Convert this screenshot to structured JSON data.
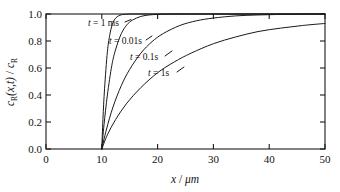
{
  "figure": {
    "background_color": "#ffffff",
    "line_color": "#1a1a1a"
  },
  "chart_data": {
    "type": "line",
    "title": "",
    "xlabel": "x / μm",
    "ylabel": "c_R(x,t) / c_R",
    "xlim": [
      0,
      50
    ],
    "ylim": [
      0.0,
      1.0
    ],
    "xticks": [
      0,
      10,
      20,
      30,
      40,
      50
    ],
    "xtick_labels": [
      "0",
      "10",
      "20",
      "30",
      "40",
      "50"
    ],
    "yticks": [
      0.0,
      0.2,
      0.4,
      0.6,
      0.8,
      1.0
    ],
    "ytick_labels": [
      "0.0",
      "0.2",
      "0.4",
      "0.6",
      "0.8",
      "1.0"
    ],
    "grid": false,
    "legend_position": "inline-annotations",
    "x_origin_of_diffusion": 10,
    "series": [
      {
        "name": "t = 1 ms",
        "label": "t = 1 ms",
        "x": [
          10,
          10.2,
          10.5,
          11,
          11.5,
          12,
          12.5,
          13,
          13.5,
          14,
          15,
          16,
          18,
          20,
          25,
          30,
          40,
          50
        ],
        "values": [
          0.0,
          0.22,
          0.45,
          0.72,
          0.86,
          0.935,
          0.97,
          0.986,
          0.994,
          0.997,
          0.9995,
          1.0,
          1.0,
          1.0,
          1.0,
          1.0,
          1.0,
          1.0
        ]
      },
      {
        "name": "t = 0.01s",
        "label": "t = 0.01s",
        "x": [
          10,
          10.4,
          11,
          11.8,
          12.5,
          13.5,
          14.5,
          15.5,
          17,
          18.5,
          20,
          22,
          25,
          30,
          35,
          40,
          45,
          50
        ],
        "values": [
          0.0,
          0.18,
          0.4,
          0.62,
          0.74,
          0.855,
          0.92,
          0.955,
          0.982,
          0.993,
          0.997,
          0.9992,
          1.0,
          1.0,
          1.0,
          1.0,
          1.0,
          1.0
        ]
      },
      {
        "name": "t = 0.1s",
        "label": "t = 0.1s",
        "x": [
          10,
          10.8,
          12,
          13.5,
          15,
          17,
          19,
          21,
          24,
          27,
          30,
          34,
          38,
          42,
          46,
          50
        ],
        "values": [
          0.0,
          0.14,
          0.31,
          0.47,
          0.59,
          0.71,
          0.795,
          0.855,
          0.915,
          0.95,
          0.97,
          0.986,
          0.993,
          0.997,
          0.999,
          1.0
        ]
      },
      {
        "name": "t = 1s",
        "label": "t = 1s",
        "x": [
          10,
          11,
          12.5,
          14.5,
          17,
          20,
          23,
          26,
          30,
          34,
          38,
          42,
          46,
          50
        ],
        "values": [
          0.0,
          0.105,
          0.22,
          0.34,
          0.455,
          0.565,
          0.645,
          0.71,
          0.78,
          0.83,
          0.87,
          0.895,
          0.915,
          0.93
        ]
      }
    ],
    "annotations": [
      {
        "text": "t = 1 ms",
        "x_px": 88,
        "y_px": 24
      },
      {
        "text": "t = 0.01s",
        "x_px": 109,
        "y_px": 42
      },
      {
        "text": "t = 0.1s",
        "x_px": 130,
        "y_px": 58
      },
      {
        "text": "t = 1s",
        "x_px": 148,
        "y_px": 74
      }
    ]
  },
  "axes": {
    "y_label_parts": {
      "c1": "c",
      "sub1": "R",
      "arg": "(x,t)",
      "slash": " / ",
      "c2": "c",
      "sub2": "R"
    },
    "x_label_parts": {
      "var": "x",
      "slash": " / ",
      "unit": "μm"
    }
  }
}
